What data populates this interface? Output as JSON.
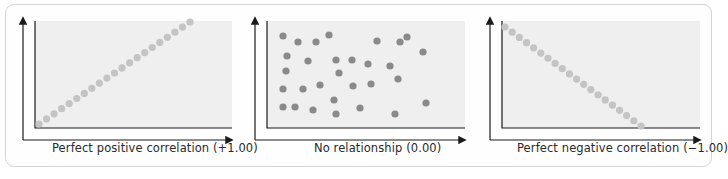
{
  "colors": {
    "plot_bg": "#efefef",
    "axis": "#1a1a1a",
    "dot_light": "#c4c4c4",
    "dot_dark": "#8a8a8a",
    "frame_border": "#d4d4d4",
    "label_text": "#2a2a2a"
  },
  "chart_data": [
    {
      "type": "scatter",
      "title": "Perfect positive correlation (+1.00)",
      "xlabel": "Perfect positive correlation (+1.00)",
      "ylabel": "",
      "correlation": 1.0,
      "grid": false,
      "points": [
        [
          0,
          0
        ],
        [
          1,
          1
        ],
        [
          2,
          2
        ],
        [
          3,
          3
        ],
        [
          4,
          4
        ],
        [
          5,
          5
        ],
        [
          6,
          6
        ],
        [
          7,
          7
        ],
        [
          8,
          8
        ],
        [
          9,
          9
        ],
        [
          10,
          10
        ],
        [
          11,
          11
        ],
        [
          12,
          12
        ],
        [
          13,
          13
        ],
        [
          14,
          14
        ],
        [
          15,
          15
        ],
        [
          16,
          16
        ],
        [
          17,
          17
        ],
        [
          18,
          18
        ],
        [
          19,
          19
        ],
        [
          20,
          20
        ]
      ]
    },
    {
      "type": "scatter",
      "title": "No relationship (0.00)",
      "xlabel": "No relationship (0.00)",
      "ylabel": "",
      "correlation": 0.0,
      "grid": false,
      "points": [
        [
          283,
          36
        ],
        [
          298,
          42
        ],
        [
          316,
          42
        ],
        [
          329,
          35
        ],
        [
          377,
          41
        ],
        [
          400,
          42
        ],
        [
          407,
          37
        ],
        [
          423,
          52
        ],
        [
          287,
          56
        ],
        [
          308,
          61
        ],
        [
          336,
          60
        ],
        [
          352,
          60
        ],
        [
          368,
          64
        ],
        [
          390,
          66
        ],
        [
          286,
          71
        ],
        [
          339,
          73
        ],
        [
          398,
          79
        ],
        [
          283,
          89
        ],
        [
          303,
          89
        ],
        [
          320,
          85
        ],
        [
          353,
          86
        ],
        [
          371,
          84
        ],
        [
          334,
          100
        ],
        [
          283,
          107
        ],
        [
          295,
          107
        ],
        [
          313,
          110
        ],
        [
          336,
          114
        ],
        [
          360,
          108
        ],
        [
          395,
          114
        ],
        [
          426,
          103
        ]
      ]
    },
    {
      "type": "scatter",
      "title": "Perfect negative correlation (−1.00)",
      "xlabel": "Perfect negative correlation (−1.00)",
      "ylabel": "",
      "correlation": -1.0,
      "grid": false,
      "points": [
        [
          0,
          19
        ],
        [
          1,
          18
        ],
        [
          2,
          17
        ],
        [
          3,
          16
        ],
        [
          4,
          15
        ],
        [
          5,
          14
        ],
        [
          6,
          13
        ],
        [
          7,
          12
        ],
        [
          8,
          11
        ],
        [
          9,
          10
        ],
        [
          10,
          9
        ],
        [
          11,
          8
        ],
        [
          12,
          7
        ],
        [
          13,
          6
        ],
        [
          14,
          5
        ],
        [
          15,
          4
        ],
        [
          16,
          3
        ],
        [
          17,
          2
        ],
        [
          18,
          1
        ],
        [
          19,
          0
        ]
      ]
    }
  ],
  "labels": {
    "positive": "Perfect positive correlation (+1.00)",
    "none": "No relationship (0.00)",
    "negative": "Perfect negative correlation (−1.00)"
  }
}
